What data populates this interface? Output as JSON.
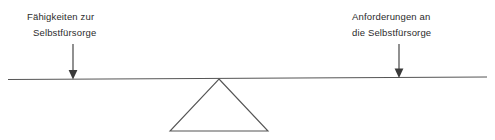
{
  "diagram": {
    "type": "seesaw-balance-diagram",
    "background_color": "#ffffff",
    "stroke_color": "#555555",
    "text_color": "#2b2b2b",
    "labels": {
      "left": {
        "line1": "Fähigkeiten zur",
        "line2": "Selbstfürsorge"
      },
      "right": {
        "line1": "Anforderungen an",
        "line2": "die Selbstfürsorge"
      }
    },
    "icons": {
      "left_arrow": "arrow-down-icon",
      "right_arrow": "arrow-down-icon",
      "beam": "balance-beam-line",
      "fulcrum": "triangle-fulcrum"
    }
  }
}
